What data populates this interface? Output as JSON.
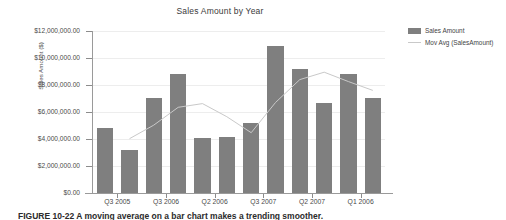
{
  "chart_data": {
    "type": "bar",
    "title": "Sales Amount by Year",
    "xlabel": "",
    "ylabel": "Sales Amount ($)",
    "ylim": [
      0,
      12000000
    ],
    "ytick_labels": [
      "$12,000,000.00",
      "$10,000,000.00",
      "$8,000,000.00",
      "$6,000,000.00",
      "$4,000,000.00",
      "$2,000,000.00",
      "$0.00"
    ],
    "ytick_values": [
      12000000,
      10000000,
      8000000,
      6000000,
      4000000,
      2000000,
      0
    ],
    "grid": true,
    "legend_position": "right",
    "categories": [
      "",
      "Q3 2005",
      "",
      "Q3 2006",
      "",
      "Q2 2006",
      "",
      "Q3 2007",
      "",
      "Q2 2007",
      "",
      "Q1 2006"
    ],
    "xtick_labels": [
      "Q3 2005",
      "Q3 2006",
      "Q2 2006",
      "Q3 2007",
      "Q2 2007",
      "Q1 2006"
    ],
    "series": [
      {
        "name": "Sales Amount",
        "type": "bar",
        "color": "#7f7f7f",
        "values": [
          4850000,
          3200000,
          7050000,
          8800000,
          4050000,
          4150000,
          5200000,
          10900000,
          9200000,
          6700000,
          8850000,
          7050000
        ]
      },
      {
        "name": "Mov Avg (SalesAmount)",
        "type": "line",
        "color": "#c9c9c9",
        "values": [
          null,
          4020000,
          5030000,
          6350000,
          6620000,
          5650000,
          4470000,
          6700000,
          8400000,
          8950000,
          8250000,
          7600000
        ]
      }
    ]
  },
  "legend": {
    "items": [
      {
        "label": "Sales Amount",
        "marker": "bar-swatch",
        "color": "#7f7f7f"
      },
      {
        "label": "Mov Avg (SalesAmount)",
        "marker": "line-swatch",
        "color": "#c9c9c9"
      }
    ]
  },
  "caption": {
    "text": "FIGURE 10-22  A moving average on a bar chart makes a trending smoother."
  }
}
